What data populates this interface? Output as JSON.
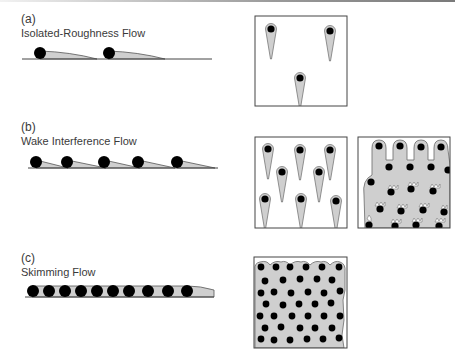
{
  "figure": {
    "colors": {
      "wake_fill": "#cfcfcf",
      "element": "#000000",
      "outline": "#555555",
      "wake_edge": "#777777"
    },
    "panels": [
      {
        "letter": "(a)",
        "title": "Isolated-Roughness Flow"
      },
      {
        "letter": "(b)",
        "title": "Wake Interference Flow"
      },
      {
        "letter": "(c)",
        "title": "Skimming Flow"
      }
    ]
  }
}
